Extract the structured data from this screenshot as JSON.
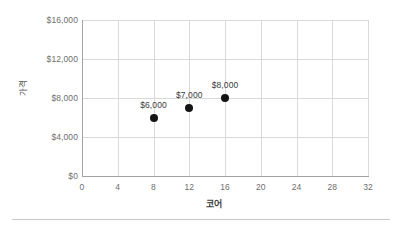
{
  "chart_data": {
    "type": "scatter",
    "title": "",
    "subtitle": "",
    "xlabel": "코어",
    "ylabel": "가격",
    "x": [
      8,
      12,
      16
    ],
    "values": [
      6000,
      7000,
      8000
    ],
    "point_labels": [
      "$6,000",
      "$7,000",
      "$8,000"
    ],
    "xlim": [
      0,
      32
    ],
    "ylim": [
      0,
      16000
    ],
    "xticks": [
      0,
      4,
      8,
      12,
      16,
      20,
      24,
      28,
      32
    ],
    "xtick_labels": [
      "0",
      "4",
      "8",
      "12",
      "16",
      "20",
      "24",
      "28",
      "32"
    ],
    "yticks": [
      0,
      4000,
      8000,
      12000,
      16000
    ],
    "ytick_labels": [
      "$0",
      "$4,000",
      "$8,000",
      "$12,000",
      "$16,000"
    ],
    "grid": true,
    "grid_axes": "both",
    "legend": false,
    "legend_position": "none",
    "marker_color": "#141414",
    "marker_shape": "circle",
    "gridline_color": "#d9d9d9",
    "axisline_color": "#a3a3a3",
    "tick_label_color": "#6e6e6e",
    "background_color": "#ffffff"
  }
}
